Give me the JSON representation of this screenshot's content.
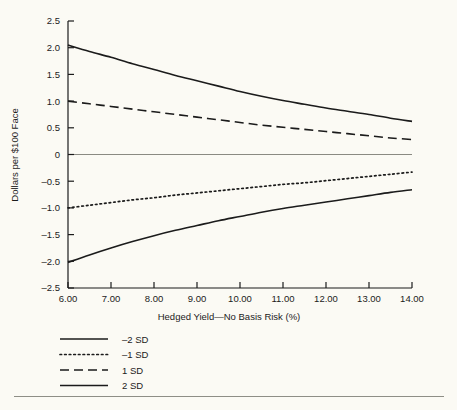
{
  "chart_data": {
    "type": "line",
    "title": "",
    "xlabel": "Hedged Yield—No Basis Risk (%)",
    "ylabel": "Dollars per $100 Face",
    "xlim": [
      6.0,
      14.0
    ],
    "ylim": [
      -2.5,
      2.5
    ],
    "grid": false,
    "zero_line": true,
    "legend_position": "below-left",
    "xticks": [
      "6.00",
      "7.00",
      "8.00",
      "9.00",
      "10.00",
      "11.00",
      "12.00",
      "13.00",
      "14.00"
    ],
    "yticks": [
      "2.5",
      "2.0",
      "1.5",
      "1.0",
      "0.5",
      "0",
      "-0.5",
      "-1.0",
      "-1.5",
      "-2.0",
      "-2.5"
    ],
    "x": [
      6.0,
      6.5,
      7.0,
      7.5,
      8.0,
      8.5,
      9.0,
      9.5,
      10.0,
      10.5,
      11.0,
      11.5,
      12.0,
      12.5,
      13.0,
      13.5,
      14.0
    ],
    "series": [
      {
        "name": "2 SD",
        "style": "solid",
        "color": "#1b1b1b",
        "values": [
          2.05,
          1.93,
          1.82,
          1.7,
          1.59,
          1.48,
          1.38,
          1.28,
          1.18,
          1.09,
          1.01,
          0.94,
          0.87,
          0.81,
          0.75,
          0.68,
          0.62
        ]
      },
      {
        "name": "1 SD",
        "style": "dashed",
        "color": "#1b1b1b",
        "values": [
          1.0,
          0.95,
          0.9,
          0.85,
          0.8,
          0.75,
          0.7,
          0.65,
          0.6,
          0.55,
          0.51,
          0.47,
          0.43,
          0.39,
          0.35,
          0.31,
          0.28
        ]
      },
      {
        "name": "-1 SD",
        "style": "dotted",
        "color": "#1b1b1b",
        "values": [
          -1.0,
          -0.95,
          -0.9,
          -0.85,
          -0.81,
          -0.76,
          -0.72,
          -0.68,
          -0.64,
          -0.6,
          -0.56,
          -0.53,
          -0.49,
          -0.45,
          -0.41,
          -0.37,
          -0.33
        ]
      },
      {
        "name": "-2 SD",
        "style": "solid",
        "color": "#1b1b1b",
        "values": [
          -2.02,
          -1.88,
          -1.75,
          -1.63,
          -1.52,
          -1.42,
          -1.33,
          -1.24,
          -1.16,
          -1.08,
          -1.01,
          -0.95,
          -0.89,
          -0.83,
          -0.77,
          -0.71,
          -0.66
        ]
      }
    ],
    "legend": [
      {
        "label": "–2 SD",
        "style": "solid"
      },
      {
        "label": "–1 SD",
        "style": "dotted"
      },
      {
        "label": "1 SD",
        "style": "dashed"
      },
      {
        "label": "2 SD",
        "style": "solid"
      }
    ]
  }
}
